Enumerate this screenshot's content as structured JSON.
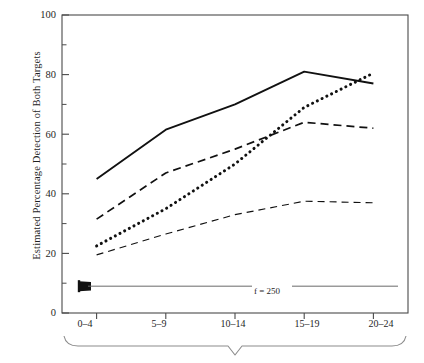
{
  "chart_data": {
    "type": "line",
    "title": "",
    "xlabel": "",
    "ylabel": "Estimated Percentage Detection of Both Targets",
    "categories": [
      "0–4",
      "5–9",
      "10–14",
      "15–19",
      "20–24"
    ],
    "ylim": [
      0,
      100
    ],
    "yticks": [
      0,
      20,
      40,
      60,
      80,
      100
    ],
    "ytick_labels": [
      "0",
      "20",
      "40",
      "60",
      "80",
      "100"
    ],
    "yminor_ticks": [
      10,
      30,
      50,
      70,
      90
    ],
    "grid": false,
    "legend": "none",
    "series": [
      {
        "name": "solid",
        "style": "solid",
        "values": [
          45,
          61.5,
          70,
          81,
          77
        ]
      },
      {
        "name": "dotted",
        "style": "dotted",
        "values": [
          22.5,
          35,
          50,
          69,
          80.5
        ]
      },
      {
        "name": "dashed-medium",
        "style": "dashed",
        "values": [
          31.5,
          47,
          55,
          64,
          62
        ]
      },
      {
        "name": "dashed-thin",
        "style": "dashed-thin",
        "values": [
          19.5,
          26.5,
          33,
          37.5,
          37
        ]
      }
    ],
    "annotations": [
      {
        "text": "f = 250",
        "y_value": 9,
        "arrow": "left"
      }
    ]
  },
  "axis": {
    "y_label_text": "Estimated Percentage Detection of Both Targets",
    "y_tick_0": "0",
    "y_tick_20": "20",
    "y_tick_40": "40",
    "y_tick_60": "60",
    "y_tick_80": "80",
    "y_tick_100": "100",
    "x_tick_1": "0–4",
    "x_tick_2": "5–9",
    "x_tick_3": "10–14",
    "x_tick_4": "15–19",
    "x_tick_5": "20–24"
  },
  "annotation": {
    "f_label": "f = 250"
  },
  "colors": {
    "line": "#111111",
    "axis": "#4a4a4a",
    "brace": "#8c8c8c",
    "background": "#ffffff"
  }
}
